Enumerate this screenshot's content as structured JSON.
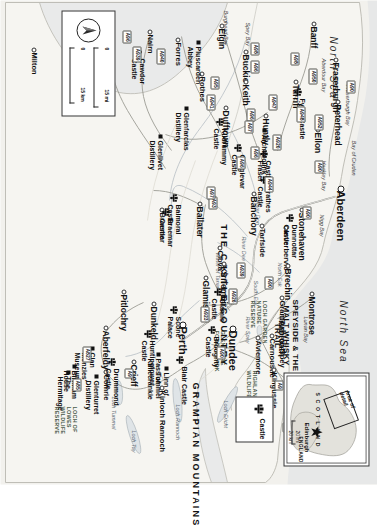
{
  "map": {
    "title": "Northeast Scotland - Castle Country & Speyside",
    "projection_note": "map printed rotated 90 degrees clockwise",
    "colors": {
      "land": "#f4f3ef",
      "sea": "#e9eaea",
      "border": "#3a3a36",
      "road": "#ffffff",
      "ink": "#111111"
    },
    "sea_labels": [
      {
        "text": "North Sea",
        "x": 36,
        "y": 40
      },
      {
        "text": "North Sea",
        "x": 300,
        "y": 30
      }
    ],
    "bays": [
      {
        "text": "Spey Bay",
        "x": 22,
        "y": 128
      },
      {
        "text": "Burghead Bay",
        "x": 10,
        "y": 150
      },
      {
        "text": "Aberdour Bay",
        "x": 58,
        "y": 52
      },
      {
        "text": "Fraserburgh Bay",
        "x": 84,
        "y": 28
      },
      {
        "text": "Bay of Cruden",
        "x": 140,
        "y": 22
      },
      {
        "text": "Hackley Bay",
        "x": 160,
        "y": 52
      },
      {
        "text": "Nigg Bay",
        "x": 214,
        "y": 54
      },
      {
        "text": "Lunan Bay",
        "x": 316,
        "y": 70
      }
    ],
    "waterways": [
      {
        "text": "River Spey",
        "x": 316,
        "y": 128
      },
      {
        "text": "Loch Ness",
        "x": 438,
        "y": 78
      },
      {
        "text": "Loch Tay",
        "x": 430,
        "y": 242
      },
      {
        "text": "Loch Rannoch",
        "x": 404,
        "y": 198
      },
      {
        "text": "Loch Ericht",
        "x": 400,
        "y": 150
      },
      {
        "text": "Loch Tummel",
        "x": 396,
        "y": 262
      },
      {
        "text": "South Esk",
        "x": 280,
        "y": 120
      },
      {
        "text": "North Esk",
        "x": 262,
        "y": 96
      },
      {
        "text": "River Dee",
        "x": 236,
        "y": 132
      },
      {
        "text": "River Don",
        "x": 200,
        "y": 118
      },
      {
        "text": "Water of Tanar",
        "x": 252,
        "y": 158
      }
    ],
    "regions": [
      {
        "text": "GRAMPIAN MOUNTAINS",
        "x": 382,
        "y": 178
      },
      {
        "text": "THE CASTLE COUNTRY",
        "x": 224,
        "y": 150
      },
      {
        "text": "SPEYSIDE & THE MALT WHISKY TRAIL",
        "x": 292,
        "y": 78
      }
    ],
    "parks": [
      {
        "text": "GLEN MORE FOREST PARK",
        "x": 330,
        "y": 152
      },
      {
        "text": "HIGHLAND WILDLIFE PARK",
        "x": 370,
        "y": 120
      },
      {
        "text": "LOCH GARDEN NATURE RESERVE",
        "x": 300,
        "y": 110
      },
      {
        "text": "LOCH OF LOWES WILDLIFE RESERVE",
        "x": 406,
        "y": 300
      }
    ],
    "towns": [
      {
        "name": "Fraserburgh",
        "x": 62,
        "y": 38,
        "size": "town"
      },
      {
        "name": "Peterhead",
        "x": 104,
        "y": 36,
        "size": "town"
      },
      {
        "name": "Banff",
        "x": 26,
        "y": 60,
        "size": "town"
      },
      {
        "name": "Turriff",
        "x": 84,
        "y": 78,
        "size": "town"
      },
      {
        "name": "Ellon",
        "x": 132,
        "y": 56,
        "size": "town"
      },
      {
        "name": "Aberdeen",
        "x": 190,
        "y": 32,
        "size": "city"
      },
      {
        "name": "Stonehaven",
        "x": 212,
        "y": 72,
        "size": "town"
      },
      {
        "name": "Inverbervie",
        "x": 230,
        "y": 88,
        "size": "town-sm"
      },
      {
        "name": "Buckie",
        "x": 54,
        "y": 128,
        "size": "town"
      },
      {
        "name": "Elgin",
        "x": 28,
        "y": 152,
        "size": "town"
      },
      {
        "name": "Keith",
        "x": 84,
        "y": 128,
        "size": "town"
      },
      {
        "name": "Huntly",
        "x": 118,
        "y": 108,
        "size": "town"
      },
      {
        "name": "Dufftown",
        "x": 110,
        "y": 148,
        "size": "town"
      },
      {
        "name": "Rothes",
        "x": 76,
        "y": 172,
        "size": "town-sm"
      },
      {
        "name": "Forres",
        "x": 42,
        "y": 196,
        "size": "town-sm"
      },
      {
        "name": "Nairn",
        "x": 34,
        "y": 224,
        "size": "town-sm"
      },
      {
        "name": "Inverness",
        "x": 26,
        "y": 268,
        "size": "town"
      },
      {
        "name": "Dores",
        "x": 58,
        "y": 290,
        "size": "town-sm"
      },
      {
        "name": "Milton",
        "x": 52,
        "y": 340,
        "size": "town-sm"
      },
      {
        "name": "Banchory",
        "x": 196,
        "y": 120,
        "size": "town"
      },
      {
        "name": "Tarfside",
        "x": 228,
        "y": 112,
        "size": "town-sm"
      },
      {
        "name": "Ballater",
        "x": 206,
        "y": 174,
        "size": "town"
      },
      {
        "name": "Braemar",
        "x": 212,
        "y": 212,
        "size": "town-sm"
      },
      {
        "name": "Clova",
        "x": 250,
        "y": 154,
        "size": "town-sm"
      },
      {
        "name": "Brechin",
        "x": 268,
        "y": 86,
        "size": "town"
      },
      {
        "name": "Montrose",
        "x": 296,
        "y": 62,
        "size": "town"
      },
      {
        "name": "Arbroath",
        "x": 320,
        "y": 92,
        "size": "town"
      },
      {
        "name": "Carnoustie",
        "x": 338,
        "y": 102,
        "size": "town-sm"
      },
      {
        "name": "Kirriemuir",
        "x": 266,
        "y": 150,
        "size": "town"
      },
      {
        "name": "Glamis",
        "x": 280,
        "y": 168,
        "size": "town"
      },
      {
        "name": "Dundee",
        "x": 330,
        "y": 140,
        "size": "city"
      },
      {
        "name": "Perth",
        "x": 326,
        "y": 190,
        "size": "city"
      },
      {
        "name": "Dunkeld",
        "x": 306,
        "y": 220,
        "size": "town"
      },
      {
        "name": "Pitlochry",
        "x": 294,
        "y": 250,
        "size": "town"
      },
      {
        "name": "Aberfeldy",
        "x": 330,
        "y": 268,
        "size": "town"
      },
      {
        "name": "Crieff",
        "x": 364,
        "y": 240,
        "size": "town"
      },
      {
        "name": "Comrie",
        "x": 374,
        "y": 268,
        "size": "town-sm"
      },
      {
        "name": "Kinloch Rannoch",
        "x": 390,
        "y": 212,
        "size": "town-sm"
      },
      {
        "name": "Kingussie",
        "x": 372,
        "y": 100,
        "size": "town-sm"
      },
      {
        "name": "Newtonmore",
        "x": 390,
        "y": 78,
        "size": "town-sm"
      },
      {
        "name": "Aviemore",
        "x": 340,
        "y": 116,
        "size": "town-sm"
      },
      {
        "name": "Grantown-on-Spey",
        "x": 300,
        "y": 92,
        "size": "town-sm"
      }
    ],
    "castles": [
      {
        "name": "Fyvie Castle",
        "x": 98,
        "y": 72
      },
      {
        "name": "Dunnottar Castle",
        "x": 224,
        "y": 80
      },
      {
        "name": "Castle Fraser",
        "x": 160,
        "y": 106
      },
      {
        "name": "Craigievar Castle",
        "x": 154,
        "y": 132
      },
      {
        "name": "Crathes Castle",
        "x": 186,
        "y": 106
      },
      {
        "name": "Kildrummy Castle",
        "x": 128,
        "y": 150
      },
      {
        "name": "Balmoral Castle",
        "x": 204,
        "y": 196
      },
      {
        "name": "Braemar Castle",
        "x": 218,
        "y": 204
      },
      {
        "name": "Cawdor Castle",
        "x": 58,
        "y": 232
      },
      {
        "name": "Castle Cluny",
        "x": 392,
        "y": 60
      },
      {
        "name": "Blair Castle",
        "x": 366,
        "y": 190
      },
      {
        "name": "Glamis Castle",
        "x": 298,
        "y": 152
      },
      {
        "name": "Broughty Castle",
        "x": 336,
        "y": 158
      },
      {
        "name": "Scone Palace",
        "x": 316,
        "y": 196
      },
      {
        "name": "Huntingtower Castle",
        "x": 340,
        "y": 222
      },
      {
        "name": "Drummond Castle",
        "x": 368,
        "y": 258
      }
    ],
    "attractions": [
      {
        "name": "Pluscarden Abbey",
        "x": 46,
        "y": 176
      },
      {
        "name": "Glenfarclas Distillery",
        "x": 112,
        "y": 188
      },
      {
        "name": "Glenlivet Distillery",
        "x": 140,
        "y": 214
      },
      {
        "name": "Archaeolink",
        "x": 134,
        "y": 110
      },
      {
        "name": "Linn of Tummel",
        "x": 372,
        "y": 208
      },
      {
        "name": "Pass of Killiecrankie",
        "x": 358,
        "y": 216
      },
      {
        "name": "Clan Menzies' Museum",
        "x": 352,
        "y": 282
      },
      {
        "name": "Birnham House",
        "x": 370,
        "y": 300
      },
      {
        "name": "The Hermitage",
        "x": 376,
        "y": 306
      },
      {
        "name": "Glenturret Distillery",
        "x": 380,
        "y": 278
      }
    ],
    "roads": [
      {
        "label": "A90",
        "x": 80,
        "y": 22
      },
      {
        "label": "A950",
        "x": 68,
        "y": 60
      },
      {
        "label": "A98",
        "x": 52,
        "y": 78
      },
      {
        "label": "A952",
        "x": 114,
        "y": 54
      },
      {
        "label": "A948",
        "x": 106,
        "y": 72
      },
      {
        "label": "A90",
        "x": 160,
        "y": 54
      },
      {
        "label": "A947",
        "x": 94,
        "y": 100
      },
      {
        "label": "A920",
        "x": 134,
        "y": 96
      },
      {
        "label": "A96",
        "x": 108,
        "y": 122
      },
      {
        "label": "A96",
        "x": 60,
        "y": 118
      },
      {
        "label": "A98",
        "x": 42,
        "y": 118
      },
      {
        "label": "A97",
        "x": 120,
        "y": 124
      },
      {
        "label": "A96",
        "x": 146,
        "y": 118
      },
      {
        "label": "A96",
        "x": 156,
        "y": 132
      },
      {
        "label": "A944",
        "x": 176,
        "y": 104
      },
      {
        "label": "A90",
        "x": 206,
        "y": 66
      },
      {
        "label": "A941",
        "x": 94,
        "y": 162
      },
      {
        "label": "A95",
        "x": 76,
        "y": 158
      },
      {
        "label": "A93",
        "x": 196,
        "y": 160
      },
      {
        "label": "A97",
        "x": 186,
        "y": 162
      },
      {
        "label": "A939",
        "x": 262,
        "y": 132
      },
      {
        "label": "A940",
        "x": 48,
        "y": 212
      },
      {
        "label": "A939",
        "x": 46,
        "y": 236
      },
      {
        "label": "A96",
        "x": 30,
        "y": 246
      },
      {
        "label": "A9",
        "x": 380,
        "y": 94
      },
      {
        "label": "A889",
        "x": 396,
        "y": 120
      },
      {
        "label": "A9",
        "x": 368,
        "y": 244
      },
      {
        "label": "A827",
        "x": 346,
        "y": 286
      },
      {
        "label": "A85",
        "x": 378,
        "y": 296
      },
      {
        "label": "A923",
        "x": 306,
        "y": 168
      },
      {
        "label": "A926",
        "x": 288,
        "y": 140
      },
      {
        "label": "A90",
        "x": 346,
        "y": 152
      },
      {
        "label": "A90",
        "x": 276,
        "y": 104
      },
      {
        "label": "A9",
        "x": 422,
        "y": 86
      },
      {
        "label": "A831",
        "x": 432,
        "y": 70
      },
      {
        "label": "A833",
        "x": 424,
        "y": 56
      },
      {
        "label": "A82",
        "x": 414,
        "y": 44
      },
      {
        "label": "A96",
        "x": 402,
        "y": 26
      }
    ],
    "inset": {
      "area_of_detail": "Area of\ndetail",
      "country_1": "S C O T L A N D",
      "country_2": "ENGLAND",
      "capital": "Edinburgh",
      "scale_mi": "20 mi",
      "scale_km": "20 km",
      "scale_zero": "0"
    },
    "scale": {
      "miles": "15 mi",
      "km": "15 km",
      "zero": "0",
      "north": "N"
    },
    "legend": {
      "items": [
        {
          "icon": "castle-icon",
          "label": "Castle"
        }
      ]
    }
  }
}
